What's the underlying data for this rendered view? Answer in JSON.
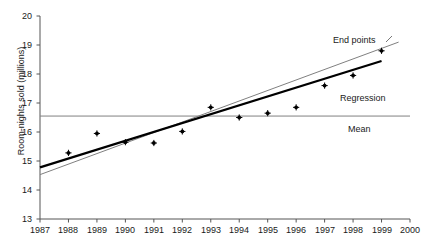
{
  "chart_data": {
    "type": "scatter",
    "title": "",
    "xlabel": "",
    "ylabel": "Room-nights sold (millions)",
    "xlim": [
      1987,
      2000
    ],
    "ylim": [
      13,
      20
    ],
    "xticks": [
      1987,
      1988,
      1989,
      1990,
      1991,
      1992,
      1993,
      1994,
      1995,
      1996,
      1997,
      1998,
      1999,
      2000
    ],
    "yticks": [
      13,
      14,
      15,
      16,
      17,
      18,
      19,
      20
    ],
    "grid": false,
    "legend_position": "inline-annotations",
    "series": [
      {
        "name": "Room-nights sold",
        "type": "scatter",
        "marker": "dot",
        "color": "#000000",
        "x": [
          1988,
          1989,
          1990,
          1991,
          1992,
          1993,
          1994,
          1995,
          1996,
          1997,
          1998,
          1999
        ],
        "values": [
          15.28,
          15.95,
          15.65,
          15.62,
          16.02,
          16.85,
          16.5,
          16.65,
          16.85,
          17.6,
          17.95,
          18.8
        ]
      },
      {
        "name": "Regression",
        "type": "line",
        "color": "#000000",
        "width": 2.2,
        "x": [
          1987,
          1999
        ],
        "values": [
          14.78,
          18.45
        ]
      },
      {
        "name": "End points",
        "type": "line",
        "color": "#808080",
        "width": 1,
        "x": [
          1987,
          1999.6
        ],
        "values": [
          14.53,
          19.1
        ]
      },
      {
        "name": "Mean",
        "type": "line",
        "color": "#808080",
        "width": 1,
        "x": [
          1987,
          2000
        ],
        "values": [
          16.55,
          16.55
        ]
      }
    ],
    "annotations": [
      {
        "name": "end-points-label",
        "text": "End points",
        "x": 333,
        "y": 35
      },
      {
        "name": "regression-label",
        "text": "Regression",
        "x": 340,
        "y": 93
      },
      {
        "name": "mean-label",
        "text": "Mean",
        "x": 348,
        "y": 124
      }
    ]
  },
  "axes": {
    "y_tick_labels": [
      "20",
      "19",
      "18",
      "17",
      "16",
      "15",
      "14",
      "13"
    ],
    "x_tick_labels": [
      "1987",
      "1988",
      "1989",
      "1990",
      "1991",
      "1992",
      "1993",
      "1994",
      "1995",
      "1996",
      "1997",
      "1998",
      "1999",
      "2000"
    ],
    "y_axis_title": "Room-nights sold (millions)"
  },
  "colors": {
    "axis": "#555555",
    "marker": "#000000",
    "regression": "#000000",
    "endpoints": "#808080",
    "mean": "#808080",
    "background": "#ffffff"
  }
}
